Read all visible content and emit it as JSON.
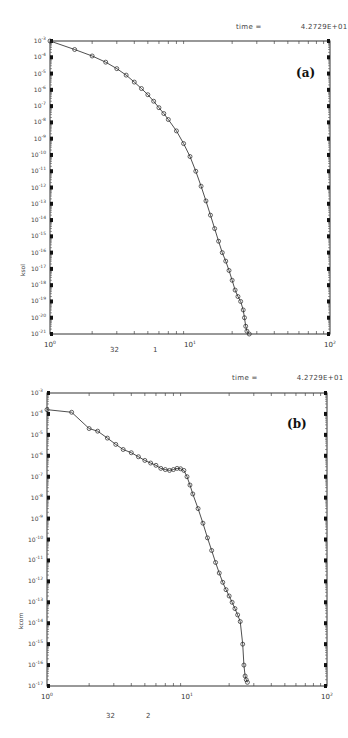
{
  "chart_data": [
    {
      "type": "line",
      "panel_label": "(a)",
      "title": "",
      "annotation": {
        "label": "time =",
        "value": "4.2729E+01"
      },
      "xlabel": "",
      "ylabel": "ksol",
      "xscale": "log",
      "yscale": "log",
      "xlim": [
        1,
        100
      ],
      "ylim": [
        1e-21,
        0.001
      ],
      "x_tick_labels": [
        "10^0",
        "10^1",
        "10^2"
      ],
      "y_tick_labels": [
        "10^-3",
        "10^-4",
        "10^-5",
        "10^-6",
        "10^-7",
        "10^-8",
        "10^-9",
        "10^-10",
        "10^-11",
        "10^-12",
        "10^-13",
        "10^-14",
        "10^-15",
        "10^-16",
        "10^-17",
        "10^-18",
        "10^-19",
        "10^-20",
        "10^-21"
      ],
      "footer": [
        "32",
        "1"
      ],
      "grid": false,
      "series": [
        {
          "name": "ksol",
          "marker": "circle",
          "x": [
            1.0,
            1.5,
            2.0,
            2.5,
            3.0,
            3.5,
            4.0,
            4.5,
            5.0,
            5.5,
            6.0,
            6.5,
            7.0,
            8.0,
            9.0,
            10.0,
            11.0,
            12.0,
            13.0,
            14.0,
            15.0,
            16.0,
            17.0,
            18.0,
            19.0,
            20.0,
            21.0,
            22.0,
            23.0,
            24.0,
            24.5,
            25.0,
            25.5,
            26.5
          ],
          "y": [
            0.001,
            0.0003,
            0.00012,
            5e-05,
            2e-05,
            8e-06,
            3e-06,
            1.2e-06,
            5e-07,
            2e-07,
            8e-08,
            3.5e-08,
            1.5e-08,
            3e-09,
            5e-10,
            8e-11,
            1e-11,
            1.2e-12,
            1.5e-13,
            2e-14,
            3e-15,
            5e-16,
            1e-16,
            3e-17,
            8e-18,
            2e-18,
            5e-19,
            2e-19,
            1e-19,
            3e-20,
            1e-20,
            3e-21,
            1.5e-21,
            5e-22
          ]
        }
      ]
    },
    {
      "type": "line",
      "panel_label": "(b)",
      "title": "",
      "annotation": {
        "label": "time =",
        "value": "4.2729E+01"
      },
      "xlabel": "",
      "ylabel": "kcom",
      "xscale": "log",
      "yscale": "log",
      "xlim": [
        1,
        100
      ],
      "ylim": [
        1e-17,
        0.001
      ],
      "x_tick_labels": [
        "10^0",
        "10^1",
        "10^2"
      ],
      "y_tick_labels": [
        "10^-3",
        "10^-4",
        "10^-5",
        "10^-6",
        "10^-7",
        "10^-8",
        "10^-9",
        "10^-10",
        "10^-11",
        "10^-12",
        "10^-13",
        "10^-14",
        "10^-15",
        "10^-16",
        "10^-17"
      ],
      "footer": [
        "32",
        "2"
      ],
      "grid": false,
      "series": [
        {
          "name": "kcom",
          "marker": "circle",
          "x": [
            1.0,
            1.5,
            2.0,
            2.3,
            2.7,
            3.1,
            3.5,
            4.0,
            4.5,
            5.0,
            5.5,
            6.0,
            6.5,
            7.0,
            7.5,
            8.0,
            8.5,
            9.0,
            9.5,
            10.0,
            10.5,
            11.0,
            12.0,
            13.0,
            14.0,
            15.0,
            16.0,
            17.0,
            18.0,
            19.0,
            20.0,
            21.0,
            22.0,
            23.0,
            24.0,
            25.0,
            25.5,
            26.0,
            26.5,
            27.0
          ],
          "y": [
            0.00016,
            0.00012,
            2e-05,
            1.5e-05,
            7e-06,
            3.5e-06,
            2e-06,
            1.4e-06,
            9e-07,
            6e-07,
            4.5e-07,
            3.5e-07,
            2.5e-07,
            2.2e-07,
            2e-07,
            2.2e-07,
            2.5e-07,
            2.4e-07,
            2e-07,
            1e-07,
            4e-08,
            1.5e-08,
            3e-09,
            6e-10,
            1.2e-10,
            3e-11,
            8e-12,
            2.5e-12,
            9e-13,
            4e-13,
            2e-13,
            1e-13,
            5e-14,
            2.5e-14,
            1.2e-14,
            1e-15,
            1e-16,
            3e-17,
            2e-17,
            1.5e-17
          ]
        }
      ]
    }
  ]
}
